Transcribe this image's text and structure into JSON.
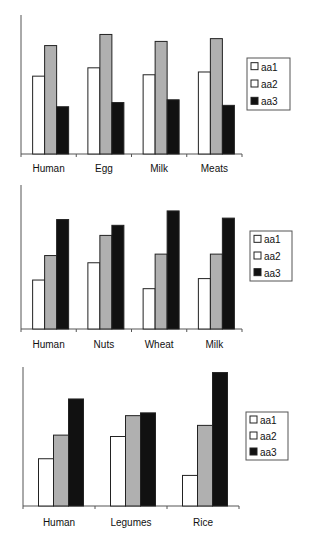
{
  "chart_data": [
    {
      "type": "bar",
      "title": "",
      "xlabel": "",
      "ylabel": "",
      "ylim": [
        0,
        100
      ],
      "grid": false,
      "legend_position": "right",
      "categories": [
        "Human",
        "Egg",
        "Milk",
        "Meats"
      ],
      "series": [
        {
          "name": "aa1",
          "color": "#ffffff",
          "values": [
            56,
            62,
            57,
            59
          ]
        },
        {
          "name": "aa2",
          "color": "#b0b0b0",
          "values": [
            78,
            86,
            81,
            83
          ]
        },
        {
          "name": "aa3",
          "color": "#111111",
          "values": [
            34,
            37,
            39,
            35
          ]
        }
      ],
      "legend_swatch_colors": [
        "#ffffff",
        "#ffffff",
        "#111111"
      ]
    },
    {
      "type": "bar",
      "title": "",
      "xlabel": "",
      "ylabel": "",
      "ylim": [
        0,
        100
      ],
      "grid": false,
      "legend_position": "right",
      "categories": [
        "Human",
        "Nuts",
        "Wheat",
        "Milk"
      ],
      "series": [
        {
          "name": "aa1",
          "color": "#ffffff",
          "values": [
            34,
            46,
            28,
            35
          ]
        },
        {
          "name": "aa2",
          "color": "#b0b0b0",
          "values": [
            51,
            65,
            52,
            52
          ]
        },
        {
          "name": "aa3",
          "color": "#111111",
          "values": [
            76,
            72,
            82,
            77
          ]
        }
      ],
      "legend_swatch_colors": [
        "#ffffff",
        "#ffffff",
        "#111111"
      ]
    },
    {
      "type": "bar",
      "title": "",
      "xlabel": "",
      "ylabel": "",
      "ylim": [
        0,
        100
      ],
      "grid": false,
      "legend_position": "right",
      "categories": [
        "Human",
        "Legumes",
        "Rice"
      ],
      "series": [
        {
          "name": "aa1",
          "color": "#ffffff",
          "values": [
            34,
            50,
            22
          ]
        },
        {
          "name": "aa2",
          "color": "#b0b0b0",
          "values": [
            51,
            65,
            58
          ]
        },
        {
          "name": "aa3",
          "color": "#111111",
          "values": [
            77,
            67,
            96
          ]
        }
      ],
      "legend_swatch_colors": [
        "#ffffff",
        "#ffffff",
        "#111111"
      ]
    }
  ]
}
